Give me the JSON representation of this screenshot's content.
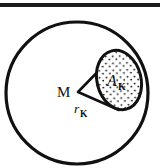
{
  "figure": {
    "background_color": "#ffffff",
    "ink_color": "#111111",
    "top_rule": {
      "name": "top-border-rule",
      "x1": 0,
      "y1": 5,
      "x2": 160,
      "y2": 5,
      "thickness": 4,
      "color": "#1a1a1a"
    },
    "outer_circle": {
      "name": "outer-circle",
      "label": "outer boundary circle",
      "cx": 77,
      "cy": 93,
      "r": 71,
      "stroke_width": 3.2,
      "fill": "none"
    },
    "center_point": {
      "name": "center-point-M",
      "x": 78,
      "y": 92
    },
    "wedge": {
      "name": "sector-wedge",
      "apex_x": 78,
      "apex_y": 92,
      "upper_end_x": 114,
      "upper_end_y": 55,
      "lower_end_x": 118,
      "lower_end_y": 109,
      "stroke_width": 2.6
    },
    "stippled_region": {
      "name": "stippled-region-Ak",
      "cx": 119,
      "cy": 80,
      "rx": 22,
      "ry": 30,
      "rotation_deg": -14,
      "stroke_width": 3.0,
      "fill": "#ffffff",
      "dot_color": "#111111",
      "dot_radius": 0.9,
      "dot_count": 64
    },
    "labels": [
      {
        "name": "label-M",
        "text": "M",
        "sub": "",
        "x": 57,
        "y": 96,
        "font_size": 15,
        "italic": false
      },
      {
        "name": "label-radius-rk",
        "text": "r",
        "sub": "K",
        "x": 74,
        "y": 113,
        "font_size": 13,
        "italic": true
      },
      {
        "name": "label-area-ak",
        "text": "A",
        "sub": "K",
        "x": 109,
        "y": 86,
        "font_size": 16,
        "italic": true
      }
    ]
  }
}
